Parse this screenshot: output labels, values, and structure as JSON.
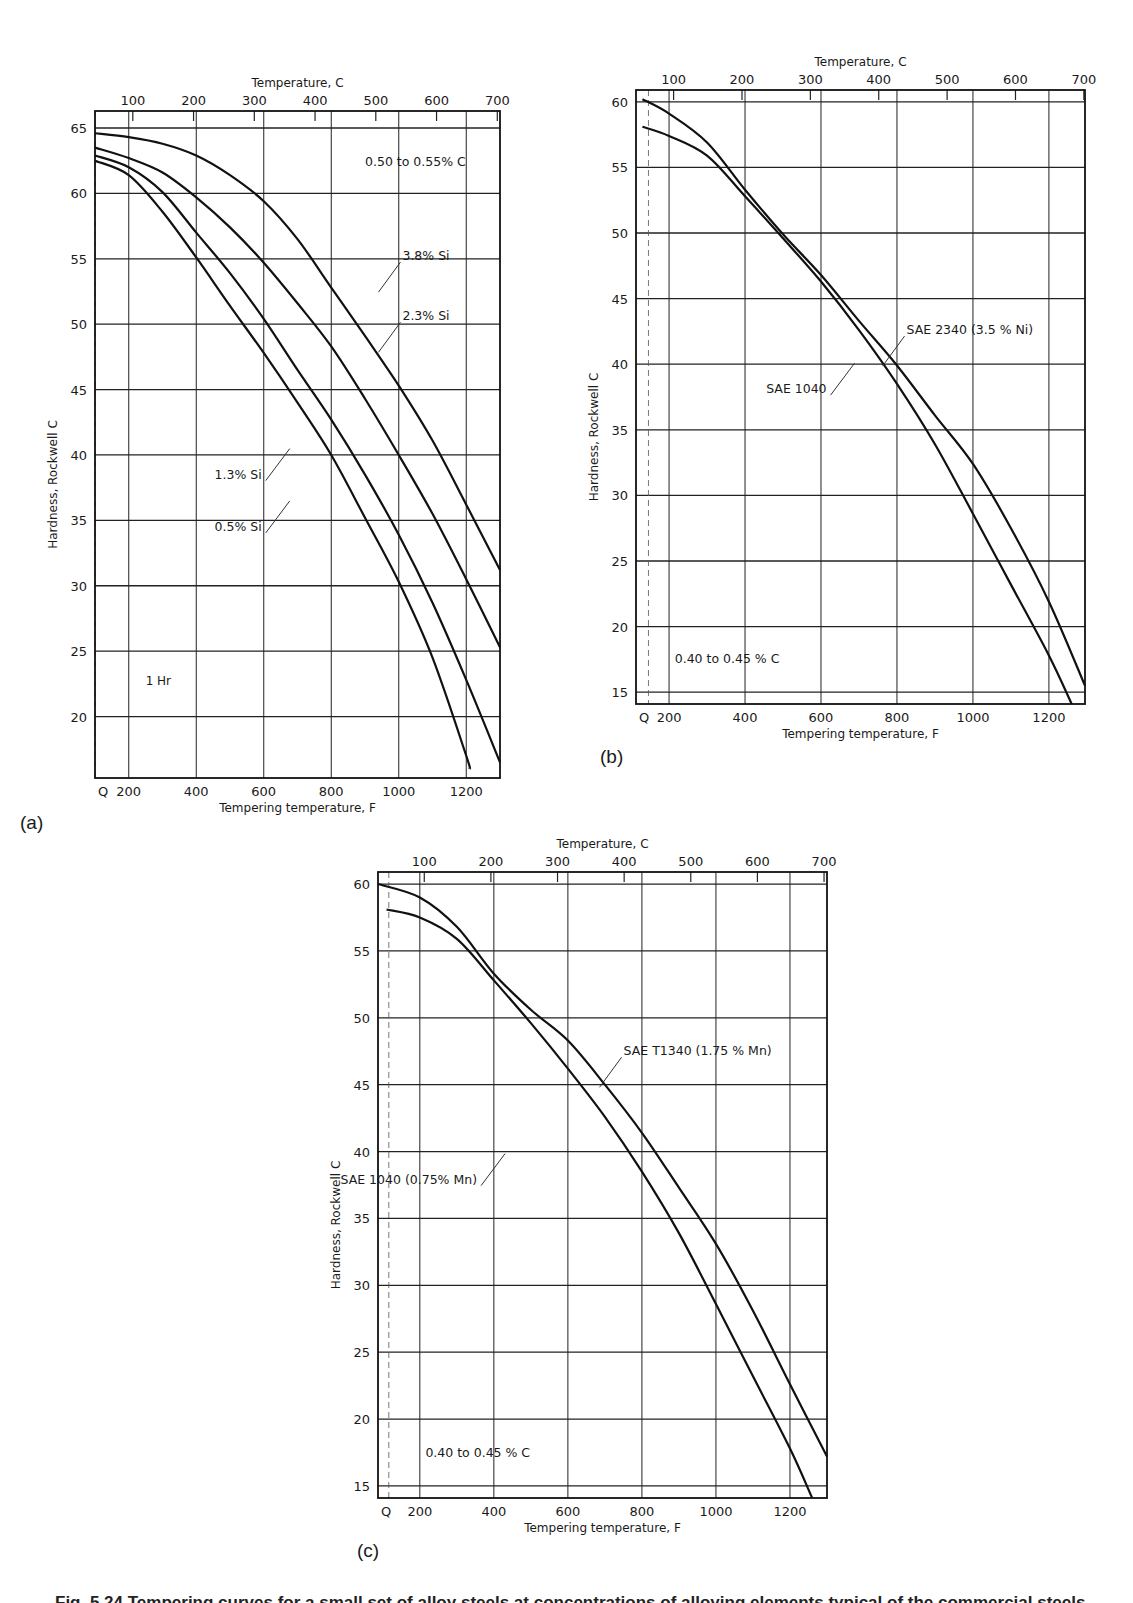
{
  "figure": {
    "panel_labels": [
      "(a)",
      "(b)",
      "(c)"
    ],
    "caption": "Fig. 5.24    Tempering curves for a small set of alloy steels at concentrations of alloying elements typical of the commercial steels"
  },
  "chart_data": [
    {
      "id": "a",
      "type": "line",
      "title": "",
      "xlabel": "Tempering temperature, F",
      "x2label": "Temperature, C",
      "ylabel": "Hardness, Rockwell C",
      "xlim": [
        100,
        1300
      ],
      "ylim": [
        15.3,
        66.3
      ],
      "xticks": [
        "Q",
        "200",
        "400",
        "600",
        "800",
        "1000",
        "1200"
      ],
      "xtick_values": [
        100,
        200,
        400,
        600,
        800,
        1000,
        1200
      ],
      "x2ticks": [
        "100",
        "200",
        "300",
        "400",
        "500",
        "600",
        "700"
      ],
      "yticks": [
        20,
        25,
        30,
        35,
        40,
        45,
        50,
        55,
        60,
        65
      ],
      "grid": true,
      "annotations": [
        "0.50 to 0.55% C",
        "1 Hr"
      ],
      "series": [
        {
          "name": "3.8% Si",
          "x": [
            100,
            200,
            300,
            400,
            500,
            600,
            700,
            800,
            900,
            1000,
            1100,
            1200,
            1300
          ],
          "values": [
            64.6,
            64.3,
            63.8,
            62.9,
            61.4,
            59.4,
            56.5,
            52.8,
            49.1,
            45.3,
            41.1,
            36.2,
            31.2
          ]
        },
        {
          "name": "2.3% Si",
          "x": [
            100,
            200,
            300,
            400,
            500,
            600,
            700,
            800,
            900,
            1000,
            1100,
            1200,
            1300
          ],
          "values": [
            63.5,
            62.7,
            61.6,
            59.7,
            57.4,
            54.7,
            51.6,
            48.3,
            44.3,
            40.0,
            35.5,
            30.5,
            25.3
          ]
        },
        {
          "name": "1.3% Si",
          "x": [
            100,
            200,
            300,
            400,
            500,
            600,
            700,
            800,
            900,
            1000,
            1100,
            1200,
            1300
          ],
          "values": [
            62.9,
            62.0,
            60.1,
            57.0,
            53.9,
            50.4,
            46.5,
            42.7,
            38.5,
            33.9,
            28.7,
            22.8,
            16.5
          ]
        },
        {
          "name": "0.5% Si",
          "x": [
            100,
            200,
            300,
            400,
            500,
            600,
            700,
            800,
            900,
            1000,
            1100,
            1200,
            1210
          ],
          "values": [
            62.5,
            61.4,
            58.6,
            55.1,
            51.4,
            47.8,
            44.0,
            40.0,
            35.2,
            30.3,
            24.5,
            17.0,
            16.0
          ]
        }
      ],
      "labels": [
        {
          "text": "3.8% Si",
          "x": 1005,
          "y": 55.2
        },
        {
          "text": "2.3% Si",
          "x": 1005,
          "y": 50.6
        },
        {
          "text": "1.3% Si",
          "x": 600,
          "y": 38.5
        },
        {
          "text": "0.5% Si",
          "x": 600,
          "y": 34.5
        }
      ]
    },
    {
      "id": "b",
      "type": "line",
      "title": "",
      "xlabel": "Tempering temperature, F",
      "x2label": "Temperature, C",
      "ylabel": "Hardness, Rockwell C",
      "xlim": [
        113,
        1295
      ],
      "ylim": [
        14.1,
        60.9
      ],
      "xticks": [
        "Q",
        "200",
        "400",
        "600",
        "800",
        "1000",
        "1200"
      ],
      "xtick_values": [
        130,
        200,
        400,
        600,
        800,
        1000,
        1200
      ],
      "x2ticks": [
        "100",
        "200",
        "300",
        "400",
        "500",
        "600",
        "700"
      ],
      "yticks": [
        15,
        20,
        25,
        30,
        35,
        40,
        45,
        50,
        55,
        60
      ],
      "grid": true,
      "annotations": [
        "0.40 to 0.45 % C"
      ],
      "series": [
        {
          "name": "SAE 2340 (3.5 % Ni)",
          "x": [
            130,
            200,
            300,
            400,
            500,
            600,
            700,
            800,
            900,
            1000,
            1100,
            1200,
            1295
          ],
          "values": [
            60.2,
            59.1,
            56.9,
            53.3,
            49.9,
            46.8,
            43.3,
            39.9,
            36.1,
            32.4,
            27.5,
            21.9,
            15.5
          ]
        },
        {
          "name": "SAE 1040",
          "x": [
            130,
            200,
            300,
            400,
            500,
            600,
            700,
            800,
            900,
            1000,
            1100,
            1200,
            1260
          ],
          "values": [
            58.1,
            57.4,
            55.9,
            52.8,
            49.6,
            46.3,
            42.6,
            38.5,
            33.9,
            28.6,
            23.2,
            17.8,
            14.1
          ]
        }
      ],
      "labels": [
        {
          "text": "SAE 2340 (3.5 % Ni)",
          "x": 820,
          "y": 42.6
        },
        {
          "text": "SAE 1040",
          "x": 620,
          "y": 38.1
        }
      ]
    },
    {
      "id": "c",
      "type": "line",
      "title": "",
      "xlabel": "Tempering temperature, F",
      "x2label": "Temperature, C",
      "ylabel": "Hardness, Rockwell C",
      "xlim": [
        87,
        1300
      ],
      "ylim": [
        14.1,
        60.9
      ],
      "xticks": [
        "Q",
        "200",
        "400",
        "600",
        "800",
        "1000",
        "1200"
      ],
      "xtick_values": [
        100,
        200,
        400,
        600,
        800,
        1000,
        1200
      ],
      "x2ticks": [
        "100",
        "200",
        "300",
        "400",
        "500",
        "600",
        "700"
      ],
      "yticks": [
        15,
        20,
        25,
        30,
        35,
        40,
        45,
        50,
        55,
        60
      ],
      "grid": true,
      "annotations": [
        "0.40 to 0.45 % C"
      ],
      "series": [
        {
          "name": "SAE T1340 (1.75 % Mn)",
          "x": [
            87,
            200,
            300,
            400,
            500,
            600,
            700,
            800,
            900,
            1000,
            1100,
            1200,
            1300
          ],
          "values": [
            60.0,
            59.0,
            56.8,
            53.3,
            50.6,
            48.3,
            45.0,
            41.4,
            37.3,
            33.1,
            28.1,
            22.6,
            17.2
          ]
        },
        {
          "name": "SAE 1040 (0.75% Mn)",
          "x": [
            110,
            200,
            300,
            400,
            500,
            600,
            700,
            800,
            900,
            1000,
            1100,
            1200,
            1260
          ],
          "values": [
            58.1,
            57.5,
            55.9,
            52.8,
            49.6,
            46.2,
            42.6,
            38.5,
            33.9,
            28.6,
            23.2,
            17.8,
            14.1
          ]
        }
      ],
      "labels": [
        {
          "text": "SAE T1340 (1.75 % Mn)",
          "x": 745,
          "y": 47.5
        },
        {
          "text": "SAE 1040 (0.75% Mn)",
          "x": 360,
          "y": 37.9
        }
      ]
    }
  ]
}
